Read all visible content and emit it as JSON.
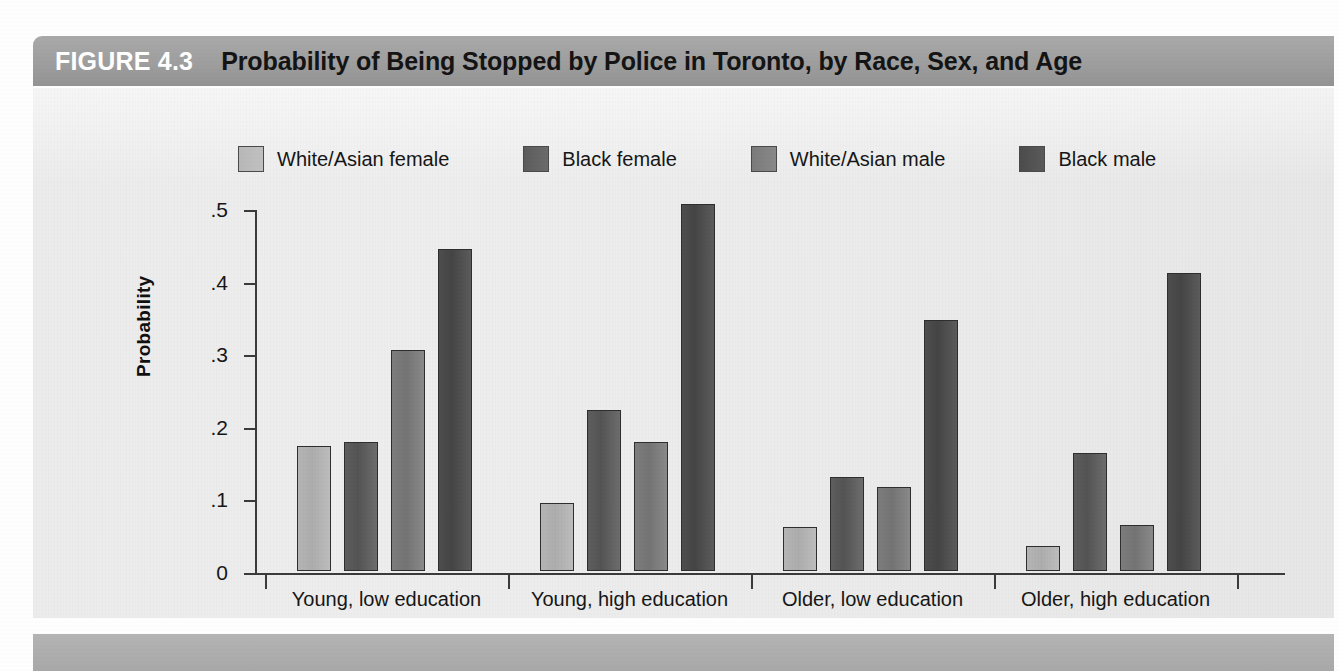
{
  "figure": {
    "number": "FIGURE 4.3",
    "title": "Probability of Being Stopped by Police in Toronto, by Race, Sex, and Age"
  },
  "colors": {
    "header_bar": "#9e9e9e",
    "panel_bg": "#ececec",
    "axis": "#3b3b3b",
    "series_white_asian_female": "#b5b5b5",
    "series_black_female": "#5e5e5e",
    "series_white_asian_male": "#7d7d7d",
    "series_black_male": "#4e4e4e"
  },
  "chart_data": {
    "type": "bar",
    "title": "Probability of Being Stopped by Police in Toronto, by Race, Sex, and Age",
    "xlabel": "",
    "ylabel": "Probability",
    "ylim": [
      0,
      0.5
    ],
    "yticks": [
      0,
      0.1,
      0.2,
      0.3,
      0.4,
      0.5
    ],
    "ytick_labels": [
      "0",
      ".1",
      ".2",
      ".3",
      ".4",
      ".5"
    ],
    "grid": false,
    "legend_position": "top-center",
    "categories": [
      "Young, low education",
      "Young, high education",
      "Older, low education",
      "Older, high education"
    ],
    "series": [
      {
        "name": "White/Asian female",
        "color": "#b5b5b5",
        "values": [
          0.172,
          0.093,
          0.061,
          0.034
        ]
      },
      {
        "name": "Black female",
        "color": "#5e5e5e",
        "values": [
          0.178,
          0.222,
          0.13,
          0.163
        ]
      },
      {
        "name": "White/Asian male",
        "color": "#7d7d7d",
        "values": [
          0.305,
          0.178,
          0.116,
          0.064
        ]
      },
      {
        "name": "Black male",
        "color": "#4e4e4e",
        "values": [
          0.443,
          0.505,
          0.346,
          0.41
        ]
      }
    ]
  }
}
